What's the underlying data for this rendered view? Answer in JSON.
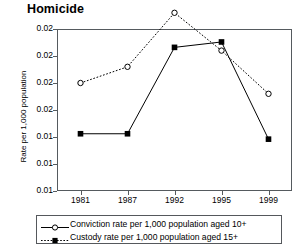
{
  "chart_data": {
    "type": "line",
    "title": "Homicide",
    "xlabel": "",
    "ylabel": "Rate per 1,000 population",
    "categories": [
      "1981",
      "1987",
      "1992",
      "1995",
      "1999"
    ],
    "ylim": [
      0.005,
      0.02
    ],
    "ytick_labels": [
      "0.02",
      "0.02",
      "0.02",
      "0.02",
      "0.01",
      "0.01",
      "0.01"
    ],
    "ytick_values": [
      0.02,
      0.0175,
      0.015,
      0.0125,
      0.01,
      0.0075,
      0.005
    ],
    "grid": false,
    "legend_position": "below-plot",
    "series": [
      {
        "name": "Conviction rate per 1,000 population aged 10+",
        "marker": "open-circle",
        "line_style": "dotted",
        "color": "#000000",
        "values": [
          0.015,
          0.0165,
          0.0215,
          0.018,
          0.014
        ]
      },
      {
        "name": "Custody rate per 1,000 population aged 15+",
        "marker": "filled-square",
        "line_style": "solid",
        "color": "#000000",
        "values": [
          0.0103,
          0.0103,
          0.0183,
          0.0188,
          0.0098
        ]
      }
    ]
  },
  "legend": {
    "items": [
      {
        "label": "Conviction rate per 1,000 population aged 10+"
      },
      {
        "label": "Custody rate per 1,000 population aged 15+"
      }
    ]
  }
}
